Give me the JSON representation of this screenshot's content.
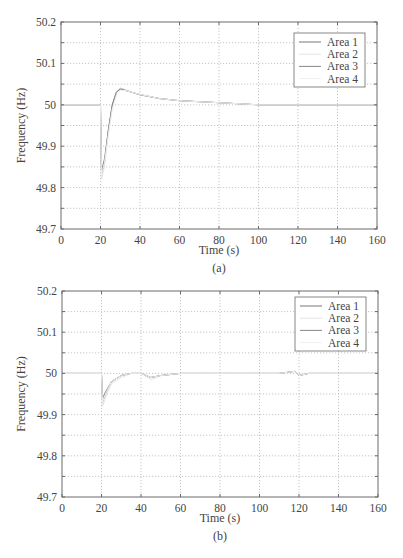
{
  "chart_data": [
    {
      "id": "a",
      "type": "line",
      "caption": "(a)",
      "xlabel": "Time (s)",
      "ylabel": "Frequency (Hz)",
      "xlim": [
        0,
        160
      ],
      "ylim": [
        49.7,
        50.2
      ],
      "xticks": [
        0,
        20,
        40,
        60,
        80,
        100,
        120,
        140,
        160
      ],
      "yticks": [
        49.7,
        49.8,
        49.9,
        50,
        50.1,
        50.2
      ],
      "grid": true,
      "legend_position": "upper right",
      "series": [
        {
          "name": "Area 1",
          "color": "#777777",
          "x": [
            0,
            20,
            20.5,
            22,
            24,
            26,
            28,
            30,
            33,
            36,
            40,
            50,
            60,
            80,
            100,
            120,
            140,
            160
          ],
          "y": [
            50,
            50,
            49.83,
            49.86,
            49.94,
            50.0,
            50.03,
            50.04,
            50.035,
            50.03,
            50.025,
            50.015,
            50.01,
            50.005,
            50.0,
            50.0,
            50.0,
            50.0
          ]
        },
        {
          "name": "Area 2",
          "color": "#e4e4e4",
          "x": [
            0,
            20,
            20.5,
            22,
            24,
            26,
            28,
            30,
            33,
            36,
            40,
            50,
            60,
            80,
            100,
            120,
            140,
            160
          ],
          "y": [
            50,
            50,
            49.82,
            49.85,
            49.93,
            49.99,
            50.03,
            50.04,
            50.036,
            50.03,
            50.025,
            50.015,
            50.01,
            50.005,
            50.0,
            50.0,
            50.0,
            50.0
          ]
        },
        {
          "name": "Area 3",
          "color": "#888888",
          "x": [
            0,
            20,
            20.5,
            22,
            24,
            26,
            28,
            30,
            33,
            36,
            40,
            50,
            60,
            80,
            100,
            120,
            140,
            160
          ],
          "y": [
            50,
            50,
            49.84,
            49.87,
            49.94,
            50.0,
            50.03,
            50.038,
            50.034,
            50.03,
            50.024,
            50.015,
            50.01,
            50.005,
            50.0,
            50.0,
            50.0,
            50.0
          ]
        },
        {
          "name": "Area 4",
          "color": "#f0f0f0",
          "x": [
            0,
            20,
            20.5,
            22,
            24,
            26,
            28,
            30,
            33,
            36,
            40,
            50,
            60,
            80,
            100,
            120,
            140,
            160
          ],
          "y": [
            50,
            50,
            49.83,
            49.86,
            49.93,
            49.99,
            50.02,
            50.035,
            50.034,
            50.03,
            50.025,
            50.015,
            50.01,
            50.005,
            50.0,
            50.0,
            50.0,
            50.0
          ]
        }
      ]
    },
    {
      "id": "b",
      "type": "line",
      "caption": "(b)",
      "xlabel": "Time (s)",
      "ylabel": "Frequency (Hz)",
      "xlim": [
        0,
        160
      ],
      "ylim": [
        49.7,
        50.2
      ],
      "xticks": [
        0,
        20,
        40,
        60,
        80,
        100,
        120,
        140,
        160
      ],
      "yticks": [
        49.7,
        49.8,
        49.9,
        50,
        50.1,
        50.2
      ],
      "grid": true,
      "legend_position": "upper right",
      "series": [
        {
          "name": "Area 1",
          "color": "#777777",
          "x": [
            0,
            20,
            20.5,
            22,
            25,
            30,
            35,
            40,
            45,
            50,
            60,
            80,
            100,
            110,
            118,
            120,
            125,
            140,
            160
          ],
          "y": [
            50,
            50,
            49.93,
            49.95,
            49.98,
            49.995,
            50.0,
            50.0,
            49.99,
            49.995,
            50.0,
            50.0,
            50.0,
            50.0,
            50.005,
            49.995,
            50.0,
            50.0,
            50.0
          ]
        },
        {
          "name": "Area 2",
          "color": "#e4e4e4",
          "x": [
            0,
            20,
            20.5,
            22,
            25,
            30,
            35,
            40,
            45,
            50,
            60,
            80,
            100,
            110,
            118,
            120,
            125,
            140,
            160
          ],
          "y": [
            50,
            50,
            49.92,
            49.94,
            49.975,
            49.99,
            50.0,
            50.0,
            49.985,
            49.995,
            50.0,
            50.0,
            50.0,
            50.0,
            50.005,
            49.995,
            50.0,
            50.0,
            50.0
          ]
        },
        {
          "name": "Area 3",
          "color": "#888888",
          "x": [
            0,
            20,
            20.5,
            22,
            25,
            30,
            35,
            40,
            45,
            50,
            60,
            80,
            100,
            110,
            118,
            120,
            125,
            140,
            160
          ],
          "y": [
            50,
            50,
            49.94,
            49.955,
            49.98,
            49.995,
            50.0,
            50.0,
            49.99,
            49.995,
            50.0,
            50.0,
            50.0,
            50.0,
            50.005,
            49.995,
            50.0,
            50.0,
            50.0
          ]
        },
        {
          "name": "Area 4",
          "color": "#f0f0f0",
          "x": [
            0,
            20,
            20.5,
            22,
            25,
            30,
            35,
            40,
            45,
            50,
            60,
            80,
            100,
            110,
            118,
            120,
            125,
            140,
            160
          ],
          "y": [
            50,
            50,
            49.93,
            49.95,
            49.98,
            49.995,
            50.0,
            50.0,
            49.99,
            49.995,
            50.0,
            50.0,
            50.0,
            50.0,
            50.005,
            49.995,
            50.0,
            50.0,
            50.0
          ]
        }
      ]
    }
  ],
  "layout": {
    "panels": [
      {
        "plot": {
          "left": 61,
          "top": 22,
          "right": 377,
          "bottom": 229
        },
        "legend": {
          "left": 294,
          "top": 33,
          "width": 71,
          "height": 54
        },
        "xlabel_y": 254,
        "caption_y": 272
      },
      {
        "plot": {
          "left": 62,
          "top": 291,
          "right": 378,
          "bottom": 497
        },
        "legend": {
          "left": 295,
          "top": 297,
          "width": 71,
          "height": 54
        },
        "xlabel_y": 522,
        "caption_y": 540
      }
    ],
    "colors": {
      "axis": "#6a6a6a",
      "grid": "#b8b8b8",
      "text": "#444444"
    }
  }
}
